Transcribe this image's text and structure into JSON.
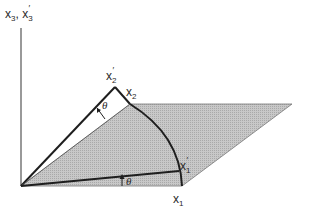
{
  "diagram": {
    "colors": {
      "background": "#ffffff",
      "plane_fill": "#bdbdbd",
      "rotated_strip_fill": "#ffffff",
      "line": "#1e1e1e",
      "axis": "#555555"
    },
    "labels": {
      "x3_axis": "x",
      "x3_sub": "3",
      "x3_sep": ", ",
      "x3p_axis": "x",
      "x3p_sub": "3",
      "x3p_prime": "′",
      "x2p": "x",
      "x2p_sub": "2",
      "x2p_prime": "′",
      "x2": "x",
      "x2_sub": "2",
      "x1p": "x",
      "x1p_sub": "1",
      "x1p_prime": "′",
      "x1": "x",
      "x1_sub": "1",
      "theta_top": "θ",
      "theta_bottom": "θ"
    },
    "points": {
      "origin": [
        21,
        186
      ],
      "x3_axis_top": [
        21,
        28
      ],
      "x2_prime_apex": [
        115,
        87
      ],
      "x2_on_arc": [
        130,
        104
      ],
      "plane_far_corner": [
        292,
        104
      ],
      "x1_on_arc": [
        182,
        186
      ],
      "x1_prime_on_arc": [
        179,
        171
      ]
    }
  }
}
